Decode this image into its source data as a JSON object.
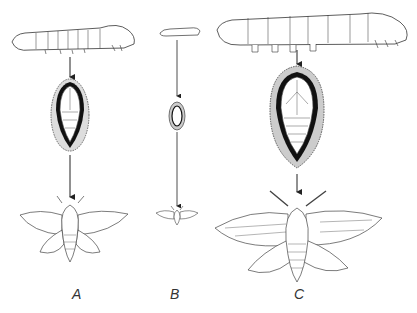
{
  "figure": {
    "stages": [
      "larva",
      "cocoon",
      "moth"
    ],
    "columns": [
      {
        "id": "A",
        "label": "A"
      },
      {
        "id": "B",
        "label": "B"
      },
      {
        "id": "C",
        "label": "C"
      }
    ],
    "colors": {
      "ink": "#222222",
      "background": "#ffffff"
    }
  }
}
